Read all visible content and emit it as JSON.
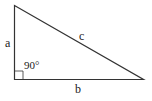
{
  "diagram": {
    "labels": {
      "side_vertical": "a",
      "side_horizontal": "b",
      "hypotenuse": "c",
      "angle": "90°"
    },
    "colors": {
      "stroke": "#333333",
      "background": "#ffffff"
    }
  }
}
